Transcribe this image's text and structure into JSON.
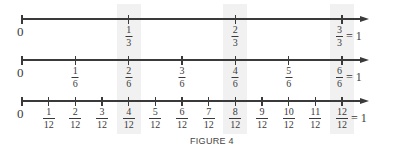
{
  "figure": {
    "caption": "FIGURE 4",
    "zero_label": "0",
    "eq_one": "= 1",
    "colors": {
      "line": "#3a3a3a",
      "shade": "#f1f1f1"
    }
  },
  "chart_data": {
    "type": "number_line",
    "title": "FIGURE 4",
    "range": [
      0,
      1
    ],
    "highlighted_values": [
      "1/3",
      "2/3",
      "1"
    ],
    "lines": [
      {
        "denominator": 3,
        "ticks": [
          {
            "num": "1",
            "den": "3"
          },
          {
            "num": "2",
            "den": "3"
          },
          {
            "num": "3",
            "den": "3",
            "eq": "= 1"
          }
        ]
      },
      {
        "denominator": 6,
        "ticks": [
          {
            "num": "1",
            "den": "6"
          },
          {
            "num": "2",
            "den": "6"
          },
          {
            "num": "3",
            "den": "6"
          },
          {
            "num": "4",
            "den": "6"
          },
          {
            "num": "5",
            "den": "6"
          },
          {
            "num": "6",
            "den": "6",
            "eq": "= 1"
          }
        ]
      },
      {
        "denominator": 12,
        "ticks": [
          {
            "num": "1",
            "den": "12"
          },
          {
            "num": "2",
            "den": "12"
          },
          {
            "num": "3",
            "den": "12"
          },
          {
            "num": "4",
            "den": "12"
          },
          {
            "num": "5",
            "den": "12"
          },
          {
            "num": "6",
            "den": "12"
          },
          {
            "num": "7",
            "den": "12"
          },
          {
            "num": "8",
            "den": "12"
          },
          {
            "num": "9",
            "den": "12"
          },
          {
            "num": "10",
            "den": "12"
          },
          {
            "num": "11",
            "den": "12"
          },
          {
            "num": "12",
            "den": "12",
            "eq": "= 1"
          }
        ]
      }
    ]
  }
}
